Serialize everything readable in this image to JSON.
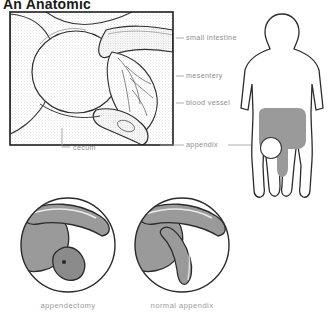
{
  "figure": {
    "title": "An Anatomic",
    "colors": {
      "organ_gray": "#9a9a9a",
      "organ_gray_dark": "#8b8b8b",
      "outline": "#2b2b2b",
      "label_text": "#8e8e8e",
      "caption_text": "#9a9a9a",
      "background": "#ffffff"
    },
    "main_panel": {
      "name": "cecum-and-appendix-detail",
      "labels": [
        {
          "id": "small-intestine",
          "text": "small intestine",
          "x": 186,
          "y": 36
        },
        {
          "id": "mesentery",
          "text": "mesentery",
          "x": 186,
          "y": 74
        },
        {
          "id": "blood-vessel",
          "text": "blood vessel",
          "x": 186,
          "y": 101
        },
        {
          "id": "cecum",
          "text": "cecum",
          "x": 73,
          "y": 146
        },
        {
          "id": "appendix",
          "text": "appendix",
          "x": 186,
          "y": 143
        }
      ]
    },
    "body_panel": {
      "name": "human-body-colon-diagram",
      "marker": "appendix-location-circle"
    },
    "insets": [
      {
        "id": "appendectomy",
        "caption": "appendectomy",
        "cx": 68,
        "cy": 245,
        "r": 47
      },
      {
        "id": "normal-appendix",
        "caption": "normal appendix",
        "cx": 182,
        "cy": 245,
        "r": 47
      }
    ]
  }
}
